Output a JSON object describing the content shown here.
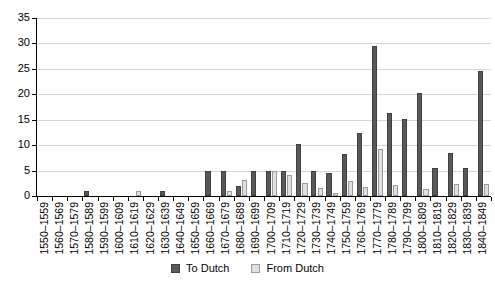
{
  "chart_data": {
    "type": "bar",
    "title": "",
    "subtitle": "",
    "xlabel": "",
    "ylabel": "",
    "ylim": [
      0,
      35
    ],
    "yticks": [
      0,
      5,
      10,
      15,
      20,
      25,
      30,
      35
    ],
    "grid": true,
    "legend_position": "bottom",
    "categories": [
      "1550–1559",
      "1560–1569",
      "1570–1579",
      "1580–1589",
      "1590–1599",
      "1600–1609",
      "1610–1619",
      "1620–1629",
      "1630–1639",
      "1640–1649",
      "1650–1659",
      "1660–1669",
      "1670–1679",
      "1680–1689",
      "1690–1699",
      "1700–1709",
      "1710–1719",
      "1720–1729",
      "1730–1739",
      "1740–1749",
      "1750–1759",
      "1760–1769",
      "1770–1779",
      "1780–1789",
      "1790–1799",
      "1800–1809",
      "1810–1819",
      "1820–1829",
      "1830–1839",
      "1840–1849"
    ],
    "series": [
      {
        "name": "To Dutch",
        "color": "#595959",
        "values": [
          0,
          0,
          0,
          1,
          0,
          0,
          0,
          0,
          1,
          0,
          0,
          5,
          5,
          2,
          5,
          5,
          5,
          10.3,
          5,
          4.6,
          8.3,
          12.3,
          29.5,
          16.3,
          15.2,
          20.3,
          5.5,
          8.5,
          5.5,
          24.5
        ]
      },
      {
        "name": "From Dutch",
        "color": "#e0e0e0",
        "values": [
          0,
          0,
          0,
          0,
          0,
          0,
          1,
          0,
          0,
          0,
          0,
          0,
          1,
          3.2,
          0,
          5,
          4.2,
          2.6,
          1.5,
          0.6,
          3,
          1.7,
          9.3,
          2.2,
          0,
          1.4,
          0,
          2.3,
          0,
          2.3
        ]
      }
    ]
  },
  "legend": {
    "items": [
      {
        "label": "To Dutch",
        "key": "to"
      },
      {
        "label": "From Dutch",
        "key": "from"
      }
    ]
  }
}
